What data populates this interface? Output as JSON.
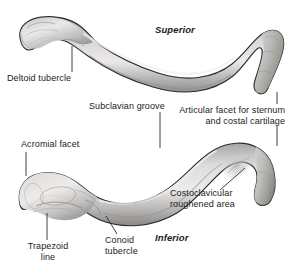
{
  "figure": {
    "background_color": "#ffffff",
    "bone_fill_light": "#e4e2e0",
    "bone_fill_mid": "#c3c1bf",
    "bone_fill_dark": "#8e8c8a",
    "outline_color": "#2b2b2b",
    "leader_color": "#2b2b2b",
    "text_color": "#1b1b1b"
  },
  "orientation": {
    "superior": "Superior",
    "inferior": "Inferior"
  },
  "labels": {
    "deltoid_tubercle": "Deltoid tubercle",
    "articular_facet_line1": "Articular facet for sternum",
    "articular_facet_line2": "and costal cartilage",
    "subclavian_groove": "Subclavian groove",
    "acromial_facet": "Acromial facet",
    "costoclavicular_line1": "Costoclavicular",
    "costoclavicular_line2": "roughened area",
    "conoid_tubercle_line1": "Conoid",
    "conoid_tubercle_line2": "tubercle",
    "trapezoid_line_line1": "Trapezoid",
    "trapezoid_line_line2": "line"
  },
  "views": [
    {
      "name": "superior-view",
      "orientation_label": "Superior",
      "features": [
        "Deltoid tubercle",
        "Articular facet for sternum and costal cartilage"
      ]
    },
    {
      "name": "inferior-view",
      "orientation_label": "Inferior",
      "features": [
        "Acromial facet",
        "Subclavian groove",
        "Costoclavicular roughened area",
        "Conoid tubercle",
        "Trapezoid line"
      ]
    }
  ]
}
